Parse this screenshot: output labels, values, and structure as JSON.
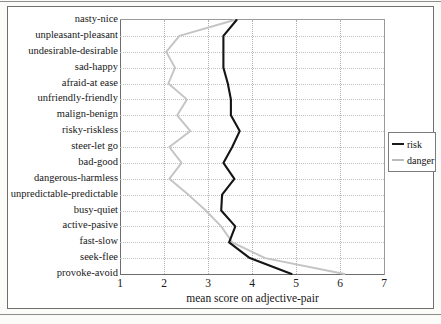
{
  "chart_data": {
    "type": "line",
    "title": "",
    "xlabel": "mean score on adjective-pair",
    "ylabel": "",
    "xlim": [
      1,
      7
    ],
    "xticks": [
      1,
      2,
      3,
      4,
      5,
      6,
      7
    ],
    "grid": true,
    "orientation": "horizontal-categories",
    "legend_position": "right",
    "categories": [
      "nasty-nice",
      "unpleasant-pleasant",
      "undesirable-desirable",
      "sad-happy",
      "afraid-at ease",
      "unfriendly-friendly",
      "malign-benign",
      "risky-riskless",
      "steer-let go",
      "bad-good",
      "dangerous-harmless",
      "unpredictable-predictable",
      "busy-quiet",
      "active-pasive",
      "fast-slow",
      "seek-flee",
      "provoke-avoid"
    ],
    "series": [
      {
        "name": "risk",
        "color": "#151515",
        "values": [
          3.65,
          3.35,
          3.35,
          3.35,
          3.45,
          3.52,
          3.52,
          3.72,
          3.55,
          3.35,
          3.6,
          3.32,
          3.3,
          3.62,
          3.48,
          3.95,
          4.9
        ]
      },
      {
        "name": "danger",
        "color": "#c4c4c4",
        "values": [
          3.6,
          2.35,
          2.05,
          2.25,
          2.1,
          2.52,
          2.3,
          2.6,
          2.12,
          2.4,
          2.12,
          2.55,
          2.95,
          3.3,
          3.55,
          4.3,
          6.1
        ]
      }
    ]
  },
  "legend": {
    "items": [
      {
        "label": "risk",
        "swatch": "solid-dark-line"
      },
      {
        "label": "danger",
        "swatch": "solid-light-line"
      }
    ]
  },
  "axis": {
    "x_tick_labels": [
      "1",
      "2",
      "3",
      "4",
      "5",
      "6",
      "7"
    ],
    "x_axis_title": "mean score on adjective-pair"
  },
  "scan": {
    "fragment_text": ""
  }
}
